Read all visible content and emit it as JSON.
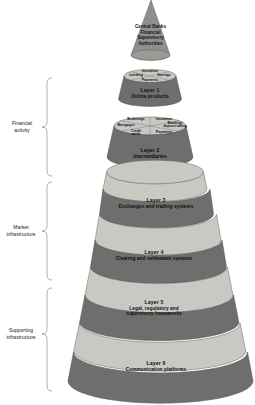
{
  "figure": {
    "type": "layered-cone-diagram",
    "background": "#ffffff"
  },
  "colors": {
    "light_band": "#c9c9c4",
    "dark_band": "#6e6e6e",
    "apex_cone": "#8f8f8d",
    "outline": "#5a5a58",
    "text": "#111111",
    "bracket": "#8d8d8d"
  },
  "apex": {
    "line1": "Central Banks",
    "line2": "Financial",
    "line3": "Supervisory",
    "line4": "Authorities"
  },
  "layers": [
    {
      "id": "layer-1",
      "title": "Layer 1",
      "subtitle": "Online products",
      "shade": "dark",
      "segments": [
        "Insurance",
        "Lending",
        "Savings",
        "Payments"
      ]
    },
    {
      "id": "layer-2",
      "title": "Layer 2",
      "subtitle": "Intermediaries",
      "shade": "dark",
      "segments": [
        "Brokerage",
        "Insurance",
        "Mortgages",
        "Banking/ deposit taking",
        "Credit cards",
        "Payments"
      ]
    },
    {
      "id": "layer-3",
      "title": "Layer 3",
      "subtitle": "Exchanges and trading systems",
      "shade": "dark",
      "segments": []
    },
    {
      "id": "layer-4",
      "title": "Layer 4",
      "subtitle": "Clearing and settlement systems",
      "shade": "dark",
      "segments": []
    },
    {
      "id": "layer-5",
      "title": "Layer 5",
      "subtitle_line1": "Legal, regulatory and",
      "subtitle_line2": "supervisory frameworks",
      "shade": "dark",
      "segments": []
    },
    {
      "id": "layer-6",
      "title": "Layer 6",
      "subtitle": "Communication platforms",
      "shade": "dark",
      "segments": []
    }
  ],
  "brackets": [
    {
      "id": "financial-activity",
      "line1": "Financial",
      "line2": "activity"
    },
    {
      "id": "market-infrastructure",
      "line1": "Market",
      "line2": "infrastructure"
    },
    {
      "id": "supporting-infrastructure",
      "line1": "Supporting",
      "line2": "infrastructure"
    }
  ],
  "segment_labels": {
    "l1_insurance": "Insurance",
    "l1_lending": "Lending",
    "l1_savings": "Savings",
    "l1_payments": "Payments",
    "l2_brokerage": "Brokerage",
    "l2_insurance": "Insurance",
    "l2_mortgages": "Mortgages",
    "l2_banking_1": "Banking/",
    "l2_banking_2": "deposit taking",
    "l2_credit_1": "Credit",
    "l2_credit_2": "cards",
    "l2_payments": "Payments"
  }
}
